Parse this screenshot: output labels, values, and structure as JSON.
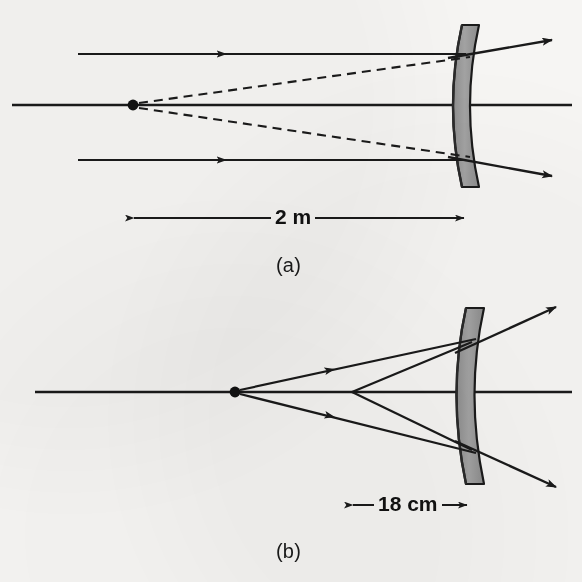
{
  "figure": {
    "background_color": "#f6f5f3",
    "ink_color": "#1a1a1a",
    "mirror_fill_color": "#9a9a9a",
    "mirror_stroke_color": "#1a1a1a"
  },
  "panels": [
    {
      "id": "a",
      "caption": "(a)",
      "caption_x": 291,
      "caption_y": 266,
      "dimension": {
        "label": "2 m",
        "label_x": 297,
        "label_y": 218,
        "x_start": 130,
        "x_end": 468,
        "y": 218
      },
      "optical_axis": {
        "x_start": 12,
        "x_end": 572,
        "y": 105
      },
      "focal_point": {
        "x": 133,
        "y": 105,
        "radius": 5
      },
      "mirror": {
        "top_y": 25,
        "bottom_y": 187,
        "front_top_x": 462,
        "front_mid_x": 448,
        "back_top_x": 479,
        "back_mid_x": 465,
        "vertex_x": 448
      },
      "incident_rays": [
        {
          "name": "upper-parallel-ray",
          "x1": 78,
          "y1": 54,
          "x2": 466,
          "y2": 54,
          "arrow_t": 0.36
        },
        {
          "name": "lower-parallel-ray",
          "x1": 78,
          "y1": 160,
          "x2": 466,
          "y2": 160,
          "arrow_t": 0.36
        }
      ],
      "virtual_rays": [
        {
          "name": "upper-virtual-extension",
          "x1": 138,
          "y1": 104,
          "x2": 468,
          "y2": 58
        },
        {
          "name": "lower-virtual-extension",
          "x1": 138,
          "y1": 107,
          "x2": 468,
          "y2": 157
        }
      ],
      "reflected_rays": [
        {
          "name": "upper-reflected-ray",
          "x1": 450,
          "y1": 57,
          "x2": 556,
          "y2": 39
        },
        {
          "name": "lower-reflected-ray",
          "x1": 450,
          "y1": 157,
          "x2": 556,
          "y2": 175
        }
      ]
    },
    {
      "id": "b",
      "caption": "(b)",
      "caption_x": 291,
      "caption_y": 552,
      "dimension": {
        "label": "18 cm",
        "label_x": 409,
        "label_y": 505,
        "x_start": 349,
        "x_end": 471,
        "y": 505
      },
      "optical_axis": {
        "x_start": 35,
        "x_end": 572,
        "y": 392
      },
      "source_point": {
        "x": 235,
        "y": 392,
        "radius": 5
      },
      "image_point": {
        "x": 352,
        "y": 392
      },
      "mirror": {
        "top_y": 308,
        "bottom_y": 484,
        "front_top_x": 466,
        "front_mid_x": 452,
        "back_top_x": 484,
        "back_mid_x": 470,
        "vertex_x": 452
      },
      "incident_rays": [
        {
          "name": "upper-incident-ray",
          "x1": 240,
          "y1": 390,
          "x2": 472,
          "y2": 340,
          "arrow_t": 0.4
        },
        {
          "name": "lower-incident-ray",
          "x1": 240,
          "y1": 394,
          "x2": 472,
          "y2": 452,
          "arrow_t": 0.4
        }
      ],
      "converging_rays": [
        {
          "name": "upper-converging-ray",
          "x1": 470,
          "y1": 342,
          "x2": 352,
          "y2": 392
        },
        {
          "name": "lower-converging-ray",
          "x1": 470,
          "y1": 450,
          "x2": 352,
          "y2": 392
        }
      ],
      "reflected_rays": [
        {
          "name": "upper-reflected-ray",
          "x1": 455,
          "y1": 352,
          "x2": 560,
          "y2": 305
        },
        {
          "name": "lower-reflected-ray",
          "x1": 455,
          "y1": 442,
          "x2": 560,
          "y2": 487
        }
      ]
    }
  ]
}
